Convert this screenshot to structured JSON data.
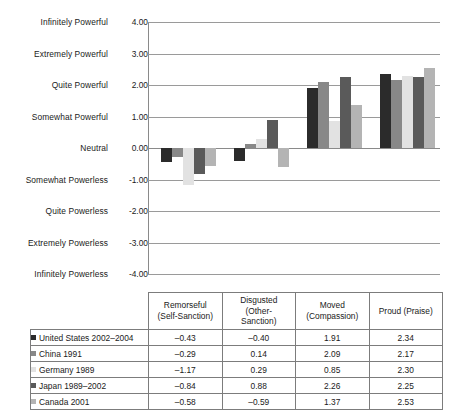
{
  "chart_data": {
    "type": "bar",
    "title": "",
    "xlabel": "",
    "ylabel": "",
    "ylim": [
      -4.0,
      4.0
    ],
    "grid": true,
    "legend_position": "table-left-column",
    "categories": [
      "Remorseful (Self-Sanction)",
      "Disgusted (Other-Sanction)",
      "Moved (Compassion)",
      "Proud (Praise)"
    ],
    "y_tick_values": [
      4.0,
      3.0,
      2.0,
      1.0,
      0.0,
      -1.0,
      -2.0,
      -3.0,
      -4.0
    ],
    "y_tick_value_labels": [
      "4.00",
      "3.00",
      "2.00",
      "1.00",
      "0.00",
      "-1.00",
      "-2.00",
      "-3.00",
      "-4.00"
    ],
    "y_tick_name_labels": [
      "Infinitely Powerful",
      "Extremely Powerful",
      "Quite Powerful",
      "Somewhat Powerful",
      "Neutral",
      "Somewhat Powerless",
      "Quite Powerless",
      "Extremely Powerless",
      "Infinitely Powerless"
    ],
    "series": [
      {
        "name": "United States 2002-2004",
        "color": "#2b2b2b",
        "values": [
          -0.43,
          -0.4,
          1.91,
          2.34
        ]
      },
      {
        "name": "China 1991",
        "color": "#888888",
        "values": [
          -0.29,
          0.14,
          2.09,
          2.17
        ]
      },
      {
        "name": "Germany 1989",
        "color": "#e2e2e2",
        "values": [
          -1.17,
          0.29,
          0.85,
          2.3
        ]
      },
      {
        "name": "Japan 1989-2002",
        "color": "#5a5a5a",
        "values": [
          -0.84,
          0.88,
          2.26,
          2.25
        ]
      },
      {
        "name": "Canada 2001",
        "color": "#b4b4b4",
        "values": [
          -0.58,
          -0.59,
          1.37,
          2.53
        ]
      }
    ]
  },
  "table": {
    "corner_label": "",
    "column_headers": [
      "Remorseful\n(Self-Sanction)",
      "Disgusted\n(Other-\nSanction)",
      "Moved\n(Compassion)",
      "Proud (Praise)"
    ],
    "column_headers_lines": [
      [
        "Remorseful",
        "(Self-Sanction)"
      ],
      [
        "Disgusted",
        "(Other-",
        "Sanction)"
      ],
      [
        "Moved",
        "(Compassion)"
      ],
      [
        "Proud (Praise)"
      ]
    ],
    "rows": [
      {
        "label": "United States 2002–2004",
        "swatch": "#2b2b2b",
        "values": [
          "–0.43",
          "–0.40",
          "1.91",
          "2.34"
        ]
      },
      {
        "label": "China 1991",
        "swatch": "#888888",
        "values": [
          "–0.29",
          "0.14",
          "2.09",
          "2.17"
        ]
      },
      {
        "label": "Germany 1989",
        "swatch": "#e2e2e2",
        "values": [
          "–1.17",
          "0.29",
          "0.85",
          "2.30"
        ]
      },
      {
        "label": "Japan 1989–2002",
        "swatch": "#5a5a5a",
        "values": [
          "–0.84",
          "0.88",
          "2.26",
          "2.25"
        ]
      },
      {
        "label": "Canada 2001",
        "swatch": "#b4b4b4",
        "values": [
          "–0.58",
          "–0.59",
          "1.37",
          "2.53"
        ]
      }
    ]
  },
  "caption": ""
}
